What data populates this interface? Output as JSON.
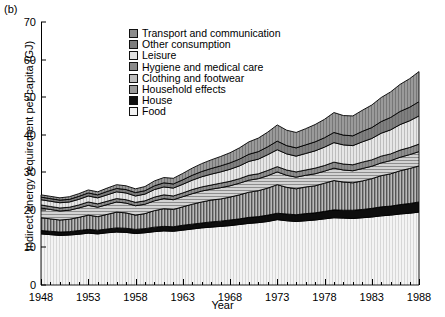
{
  "panel": {
    "label": "(b)"
  },
  "axes": {
    "ylabel": "Indirect energy requirement per capita (GJ)",
    "xlabel": "Year",
    "yticks": [
      "0",
      "10",
      "20",
      "30",
      "40",
      "50",
      "60",
      "70"
    ],
    "xticks": [
      "1948",
      "1953",
      "1958",
      "1963",
      "1968",
      "1973",
      "1978",
      "1983",
      "1988"
    ]
  },
  "legend": {
    "items": [
      {
        "label": "Transport and communication",
        "swatch": "#8c8c8c"
      },
      {
        "label": "Other consumption",
        "swatch": "#7d7d7d"
      },
      {
        "label": "Leisure",
        "swatch": "#e2e2e2"
      },
      {
        "label": "Hygiene and medical care",
        "swatch": "#8a8a8a"
      },
      {
        "label": "Clothing and footwear",
        "swatch": "#bdbdbd"
      },
      {
        "label": "Household effects",
        "swatch": "#9a9a9a"
      },
      {
        "label": "House",
        "swatch": "#101010"
      },
      {
        "label": "Food",
        "swatch": "#f2f2f2"
      }
    ]
  },
  "chart_data": {
    "type": "area",
    "title": "",
    "xlabel": "Year",
    "ylabel": "Indirect energy requirement per capita (GJ)",
    "xlim": [
      1948,
      1988
    ],
    "ylim": [
      0,
      70
    ],
    "grid": false,
    "legend_position": "inside-top-center",
    "stacked": true,
    "x": [
      1948,
      1949,
      1950,
      1951,
      1952,
      1953,
      1954,
      1955,
      1956,
      1957,
      1958,
      1959,
      1960,
      1961,
      1962,
      1963,
      1964,
      1965,
      1966,
      1967,
      1968,
      1969,
      1970,
      1971,
      1972,
      1973,
      1974,
      1975,
      1976,
      1977,
      1978,
      1979,
      1980,
      1981,
      1982,
      1983,
      1984,
      1985,
      1986,
      1987,
      1988
    ],
    "series": [
      {
        "name": "Food",
        "values": [
          13.6,
          13.4,
          13.2,
          13.3,
          13.5,
          13.8,
          13.6,
          13.9,
          14.1,
          14.0,
          13.7,
          13.9,
          14.2,
          14.4,
          14.3,
          14.6,
          14.9,
          15.2,
          15.4,
          15.6,
          15.8,
          16.1,
          16.4,
          16.6,
          16.9,
          17.4,
          17.1,
          16.9,
          17.1,
          17.3,
          17.6,
          17.9,
          17.8,
          17.7,
          17.9,
          18.1,
          18.4,
          18.6,
          18.9,
          19.1,
          19.4
        ]
      },
      {
        "name": "House",
        "values": [
          0.9,
          0.9,
          0.9,
          0.9,
          1.0,
          1.0,
          1.0,
          1.0,
          1.1,
          1.1,
          1.1,
          1.1,
          1.2,
          1.2,
          1.2,
          1.3,
          1.3,
          1.3,
          1.4,
          1.4,
          1.5,
          1.5,
          1.6,
          1.6,
          1.7,
          1.7,
          1.8,
          1.8,
          1.9,
          1.9,
          2.0,
          2.1,
          2.1,
          2.2,
          2.2,
          2.3,
          2.4,
          2.4,
          2.5,
          2.6,
          2.7
        ]
      },
      {
        "name": "Household effects",
        "values": [
          3.4,
          3.3,
          3.2,
          3.3,
          3.5,
          3.8,
          3.6,
          3.9,
          4.2,
          4.1,
          3.8,
          4.0,
          4.4,
          4.7,
          4.6,
          4.9,
          5.3,
          5.6,
          5.8,
          5.9,
          6.1,
          6.4,
          6.7,
          6.9,
          7.2,
          7.6,
          7.1,
          6.9,
          7.1,
          7.2,
          7.5,
          7.8,
          7.5,
          7.3,
          7.6,
          7.9,
          8.3,
          8.6,
          9.0,
          9.3,
          9.6
        ]
      },
      {
        "name": "Clothing and footwear",
        "values": [
          2.6,
          2.5,
          2.4,
          2.4,
          2.5,
          2.6,
          2.5,
          2.6,
          2.7,
          2.6,
          2.5,
          2.5,
          2.6,
          2.7,
          2.6,
          2.7,
          2.8,
          2.9,
          2.9,
          3.0,
          3.0,
          3.1,
          3.2,
          3.2,
          3.3,
          3.4,
          3.2,
          3.1,
          3.1,
          3.2,
          3.2,
          3.3,
          3.2,
          3.2,
          3.3,
          3.3,
          3.4,
          3.5,
          3.6,
          3.7,
          3.8
        ]
      },
      {
        "name": "Hygiene and medical care",
        "values": [
          0.8,
          0.8,
          0.8,
          0.8,
          0.8,
          0.9,
          0.9,
          0.9,
          0.9,
          0.9,
          0.9,
          0.9,
          1.0,
          1.0,
          1.0,
          1.0,
          1.1,
          1.1,
          1.1,
          1.2,
          1.2,
          1.2,
          1.3,
          1.3,
          1.4,
          1.4,
          1.4,
          1.4,
          1.4,
          1.5,
          1.5,
          1.6,
          1.6,
          1.6,
          1.7,
          1.7,
          1.8,
          1.8,
          1.9,
          1.9,
          2.0
        ]
      },
      {
        "name": "Leisure",
        "values": [
          1.4,
          1.4,
          1.4,
          1.4,
          1.5,
          1.6,
          1.6,
          1.7,
          1.8,
          1.8,
          1.7,
          1.8,
          2.0,
          2.1,
          2.1,
          2.3,
          2.5,
          2.7,
          2.9,
          3.0,
          3.2,
          3.4,
          3.7,
          3.9,
          4.2,
          4.5,
          4.3,
          4.2,
          4.4,
          4.6,
          4.9,
          5.2,
          5.1,
          5.1,
          5.4,
          5.7,
          6.1,
          6.4,
          6.8,
          7.1,
          7.5
        ]
      },
      {
        "name": "Other consumption",
        "values": [
          0.7,
          0.7,
          0.7,
          0.7,
          0.8,
          0.8,
          0.8,
          0.9,
          0.9,
          0.9,
          0.9,
          0.9,
          1.0,
          1.1,
          1.1,
          1.2,
          1.3,
          1.4,
          1.5,
          1.6,
          1.7,
          1.8,
          1.9,
          2.0,
          2.1,
          2.3,
          2.2,
          2.2,
          2.3,
          2.4,
          2.5,
          2.7,
          2.6,
          2.6,
          2.8,
          2.9,
          3.1,
          3.3,
          3.5,
          3.6,
          3.8
        ]
      },
      {
        "name": "Transport and communication",
        "values": [
          0.6,
          0.6,
          0.6,
          0.7,
          0.7,
          0.8,
          0.8,
          0.9,
          1.0,
          1.0,
          1.0,
          1.1,
          1.3,
          1.4,
          1.5,
          1.7,
          1.9,
          2.1,
          2.3,
          2.5,
          2.7,
          3.0,
          3.3,
          3.6,
          3.9,
          4.3,
          4.1,
          4.1,
          4.3,
          4.6,
          4.9,
          5.3,
          5.2,
          5.3,
          5.6,
          6.0,
          6.4,
          6.8,
          7.2,
          7.6,
          8.0
        ]
      }
    ],
    "totals_endpoints": {
      "1948": 24.0,
      "1988": 56.8
    }
  }
}
